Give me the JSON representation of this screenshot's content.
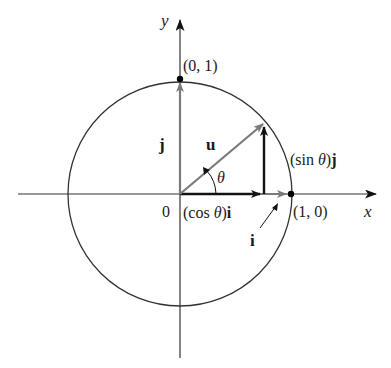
{
  "figure": {
    "axes": {
      "x_label": "x",
      "y_label": "y",
      "origin_label": "0"
    },
    "points": {
      "top": "(0, 1)",
      "right": "(1, 0)"
    },
    "vectors": {
      "u": "u",
      "j": "j",
      "i": "i",
      "cos_prefix": "(cos ",
      "cos_theta": "θ",
      "cos_suffix": ")",
      "cos_vec": "i",
      "sin_prefix": "(sin ",
      "sin_theta": "θ",
      "sin_suffix": ")",
      "sin_vec": "j"
    },
    "angle_label": "θ",
    "colors": {
      "axis": "#333333",
      "circle": "#333333",
      "gray_vector": "#7a7a7a",
      "black_vector": "#111111",
      "point": "#000000"
    }
  }
}
